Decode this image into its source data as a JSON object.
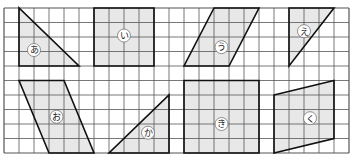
{
  "grid": {
    "origin_x": 4,
    "origin_y": 8,
    "cell_w": 15,
    "cell_h": 14.5,
    "cols": 23,
    "rows": 10,
    "line_color": "#555555",
    "border_color": "#333333"
  },
  "colors": {
    "fill": "#e8e8e8",
    "stroke": "#111111",
    "label_bg": "#ffffff",
    "label_text": "#222222"
  },
  "shapes": [
    {
      "id": "a",
      "label": "あ",
      "type": "right-triangle",
      "points": [
        [
          1,
          0
        ],
        [
          1,
          4
        ],
        [
          5,
          4
        ]
      ],
      "label_pos": [
        2.0,
        2.9
      ]
    },
    {
      "id": "i",
      "label": "い",
      "type": "rectangle",
      "points": [
        [
          6,
          0
        ],
        [
          10,
          0
        ],
        [
          10,
          4
        ],
        [
          6,
          4
        ]
      ],
      "label_pos": [
        8.0,
        1.9
      ]
    },
    {
      "id": "u",
      "label": "う",
      "type": "parallelogram",
      "points": [
        [
          14,
          0
        ],
        [
          17,
          0
        ],
        [
          15,
          4
        ],
        [
          12,
          4
        ]
      ],
      "label_pos": [
        14.5,
        2.7
      ]
    },
    {
      "id": "e",
      "label": "え",
      "type": "right-triangle",
      "points": [
        [
          19,
          0
        ],
        [
          22,
          0
        ],
        [
          19,
          4
        ]
      ],
      "label_pos": [
        20.0,
        1.6
      ]
    },
    {
      "id": "o",
      "label": "お",
      "type": "parallelogram",
      "points": [
        [
          1,
          5
        ],
        [
          4,
          5
        ],
        [
          6,
          10
        ],
        [
          3,
          10
        ]
      ],
      "label_pos": [
        3.5,
        7.5
      ]
    },
    {
      "id": "ka",
      "label": "か",
      "type": "right-triangle",
      "points": [
        [
          7,
          10
        ],
        [
          11,
          10
        ],
        [
          11,
          6
        ]
      ],
      "label_pos": [
        9.6,
        8.6
      ]
    },
    {
      "id": "ki",
      "label": "き",
      "type": "rectangle",
      "points": [
        [
          12,
          5
        ],
        [
          17,
          5
        ],
        [
          17,
          10
        ],
        [
          12,
          10
        ]
      ],
      "label_pos": [
        14.5,
        8.0
      ]
    },
    {
      "id": "ku",
      "label": "く",
      "type": "trapezoid",
      "points": [
        [
          18,
          6
        ],
        [
          22,
          5
        ],
        [
          22,
          9
        ],
        [
          18,
          10
        ]
      ],
      "label_pos": [
        20.4,
        7.6
      ]
    }
  ]
}
